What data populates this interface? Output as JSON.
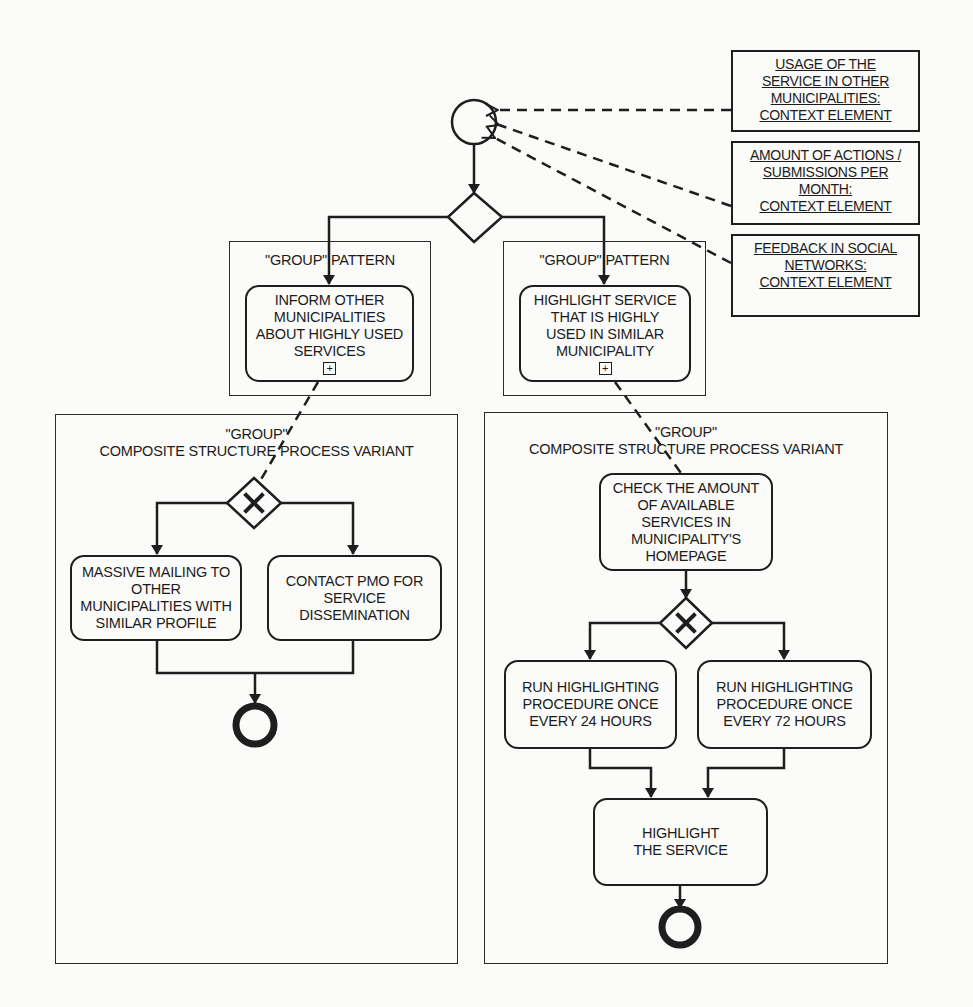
{
  "diagram": {
    "type": "BPMN process variant diagram",
    "start_event": {
      "shape": "circle"
    },
    "main_gateway": {
      "shape": "diamond",
      "marker": ""
    },
    "context_elements": [
      {
        "lines": [
          "USAGE OF THE",
          "SERVICE IN OTHER",
          "MUNICIPALITIES:",
          "CONTEXT ELEMENT"
        ]
      },
      {
        "lines": [
          "AMOUNT OF ACTIONS /",
          "SUBMISSIONS PER",
          "MONTH:",
          "CONTEXT ELEMENT"
        ]
      },
      {
        "lines": [
          "FEEDBACK IN SOCIAL",
          "NETWORKS:",
          "CONTEXT ELEMENT"
        ]
      }
    ],
    "left_branch": {
      "pattern_label": "\"GROUP\" PATTERN",
      "task_lines": [
        "INFORM OTHER",
        "MUNICIPALITIES",
        "ABOUT HIGHLY USED",
        "SERVICES"
      ],
      "subprocess_marker": "+",
      "variant": {
        "label_line1": "\"GROUP\"",
        "label_line2": "COMPOSITE STRUCTURE PROCESS VARIANT",
        "gateway_marker": "✕",
        "tasks": [
          {
            "lines": [
              "MASSIVE MAILING TO",
              "OTHER",
              "MUNICIPALITIES WITH",
              "SIMILAR PROFILE"
            ]
          },
          {
            "lines": [
              "CONTACT PMO FOR",
              "SERVICE",
              "DISSEMINATION"
            ]
          }
        ],
        "end_event": {
          "shape": "thick-circle"
        }
      }
    },
    "right_branch": {
      "pattern_label": "\"GROUP\" PATTERN",
      "task_lines": [
        "HIGHLIGHT SERVICE",
        "THAT IS HIGHLY",
        "USED IN SIMILAR",
        "MUNICIPALITY"
      ],
      "subprocess_marker": "+",
      "variant": {
        "label_line1": "\"GROUP\"",
        "label_line2": "COMPOSITE STRUCTURE PROCESS VARIANT",
        "check_task_lines": [
          "CHECK THE AMOUNT",
          "OF AVAILABLE",
          "SERVICES IN",
          "MUNICIPALITY'S",
          "HOMEPAGE"
        ],
        "gateway_marker": "✕",
        "tasks": [
          {
            "lines": [
              "RUN HIGHLIGHTING",
              "PROCEDURE ONCE",
              "EVERY 24 HOURS"
            ]
          },
          {
            "lines": [
              "RUN HIGHLIGHTING",
              "PROCEDURE ONCE",
              "EVERY 72 HOURS"
            ]
          }
        ],
        "final_task_lines": [
          "HIGHLIGHT",
          "THE SERVICE"
        ],
        "end_event": {
          "shape": "thick-circle"
        }
      }
    }
  }
}
